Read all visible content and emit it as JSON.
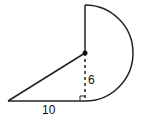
{
  "figure": {
    "labels": {
      "base": "10",
      "height": "6"
    },
    "colors": {
      "stroke": "#222222",
      "background": "#ffffff"
    }
  }
}
